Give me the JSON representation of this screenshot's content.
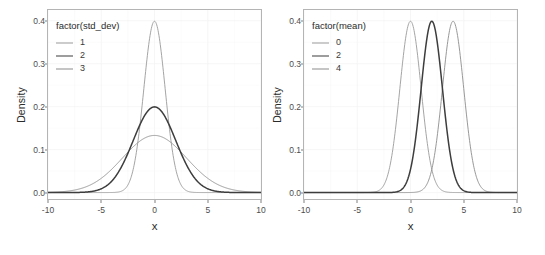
{
  "figure": {
    "panel_bg": "#ffffff",
    "panel_border": "#b4b4b4",
    "grid_color": "#f2f2f2"
  },
  "chart_data": [
    {
      "type": "line",
      "title": "",
      "subtitle": "",
      "xlabel": "x",
      "ylabel": "Density",
      "xlim": [
        -10,
        10
      ],
      "ylim": [
        -0.015,
        0.425
      ],
      "xticks": [
        -10,
        -5,
        0,
        5,
        10
      ],
      "xticklabels": [
        "-10",
        "-5",
        "0",
        "5",
        "10"
      ],
      "yticks": [
        0.0,
        0.1,
        0.2,
        0.3,
        0.4
      ],
      "yticklabels": [
        "0.0",
        "0.1",
        "0.2",
        "0.3",
        "0.4"
      ],
      "grid": true,
      "legend_title": "factor(std_dev)",
      "legend_position": "inside-top-left",
      "series": [
        {
          "name": "1",
          "label": "1",
          "color": "#9a9a9a",
          "width": 0.9,
          "distribution": "normal",
          "mean": 0,
          "std_dev": 1,
          "peak_density": 0.3989
        },
        {
          "name": "2",
          "label": "2",
          "color": "#3d3d3d",
          "width": 1.5,
          "distribution": "normal",
          "mean": 0,
          "std_dev": 2,
          "peak_density": 0.1995
        },
        {
          "name": "3",
          "label": "3",
          "color": "#8c8c8c",
          "width": 0.9,
          "distribution": "normal",
          "mean": 0,
          "std_dev": 3,
          "peak_density": 0.133
        }
      ]
    },
    {
      "type": "line",
      "title": "",
      "subtitle": "",
      "xlabel": "x",
      "ylabel": "Density",
      "xlim": [
        -10,
        10
      ],
      "ylim": [
        -0.015,
        0.425
      ],
      "xticks": [
        -10,
        -5,
        0,
        5,
        10
      ],
      "xticklabels": [
        "-10",
        "-5",
        "0",
        "5",
        "10"
      ],
      "yticks": [
        0.0,
        0.1,
        0.2,
        0.3,
        0.4
      ],
      "yticklabels": [
        "0.0",
        "0.1",
        "0.2",
        "0.3",
        "0.4"
      ],
      "grid": true,
      "legend_title": "factor(mean)",
      "legend_position": "inside-top-left",
      "series": [
        {
          "name": "0",
          "label": "0",
          "color": "#9a9a9a",
          "width": 0.9,
          "distribution": "normal",
          "mean": 0,
          "std_dev": 1,
          "peak_density": 0.3989
        },
        {
          "name": "2",
          "label": "2",
          "color": "#3d3d3d",
          "width": 1.5,
          "distribution": "normal",
          "mean": 2,
          "std_dev": 1,
          "peak_density": 0.3989
        },
        {
          "name": "4",
          "label": "4",
          "color": "#8c8c8c",
          "width": 0.9,
          "distribution": "normal",
          "mean": 4,
          "std_dev": 1,
          "peak_density": 0.3989
        }
      ]
    }
  ]
}
